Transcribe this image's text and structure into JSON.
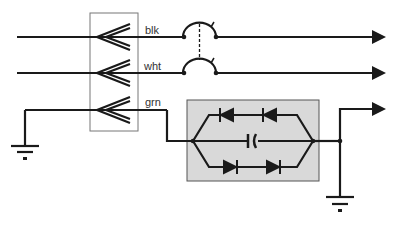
{
  "diagram": {
    "title": "",
    "wires": [
      {
        "id": "blk",
        "label": "blk"
      },
      {
        "id": "wht",
        "label": "wht"
      },
      {
        "id": "grn",
        "label": "grn"
      }
    ],
    "components": {
      "connector": "three-pin plug connector",
      "breaker": "double-pole circuit breaker (ganged)",
      "isolator": "galvanic isolator: anti-parallel diode pairs with capacitor",
      "grounds": [
        "left ground",
        "right ground"
      ]
    },
    "colors": {
      "line": "#1a1a1a",
      "box_fill": "#d9d9d9",
      "box_stroke": "#555555",
      "connector_stroke": "#777777"
    }
  }
}
